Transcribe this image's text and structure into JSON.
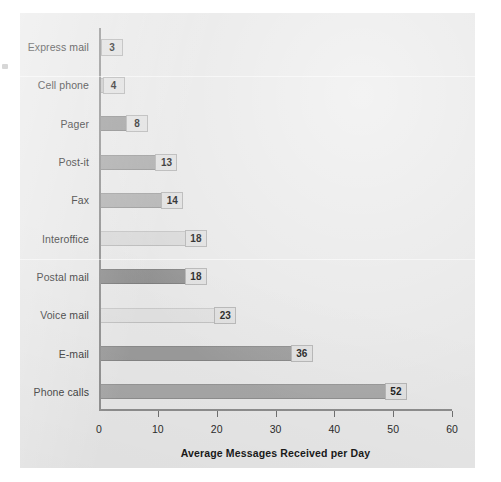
{
  "chart_data": {
    "type": "bar",
    "orientation": "horizontal",
    "title": "",
    "xlabel": "Average Messages Received per Day",
    "ylabel": "",
    "xlim": [
      0,
      60
    ],
    "xticks": [
      0,
      10,
      20,
      30,
      40,
      50,
      60
    ],
    "grid": false,
    "legend": null,
    "categories": [
      "Express mail",
      "Cell phone",
      "Pager",
      "Post-it",
      "Fax",
      "Interoffice",
      "Postal mail",
      "Voice mail",
      "E-mail",
      "Phone calls"
    ],
    "values": [
      3,
      4,
      8,
      13,
      14,
      18,
      18,
      23,
      36,
      52
    ],
    "bar_colors": [
      "#e3e3e3",
      "#c6c6c6",
      "#9b9b9b",
      "#a8a8a8",
      "#b0b0b0",
      "#d8d8d8",
      "#8f8f8f",
      "#e0e0e0",
      "#9a9a9a",
      "#a6a6a6"
    ],
    "bars": [
      {
        "label": "Express mail",
        "value": 3,
        "value_text": "3",
        "color": "#e3e3e3"
      },
      {
        "label": "Cell phone",
        "value": 4,
        "value_text": "4",
        "color": "#c6c6c6"
      },
      {
        "label": "Pager",
        "value": 8,
        "value_text": "8",
        "color": "#9b9b9b"
      },
      {
        "label": "Post-it",
        "value": 13,
        "value_text": "13",
        "color": "#a8a8a8"
      },
      {
        "label": "Fax",
        "value": 14,
        "value_text": "14",
        "color": "#b0b0b0"
      },
      {
        "label": "Interoffice",
        "value": 18,
        "value_text": "18",
        "color": "#d8d8d8"
      },
      {
        "label": "Postal mail",
        "value": 18,
        "value_text": "18",
        "color": "#8f8f8f"
      },
      {
        "label": "Voice mail",
        "value": 23,
        "value_text": "23",
        "color": "#e0e0e0"
      },
      {
        "label": "E-mail",
        "value": 36,
        "value_text": "36",
        "color": "#9a9a9a"
      },
      {
        "label": "Phone calls",
        "value": 52,
        "value_text": "52",
        "color": "#a6a6a6"
      }
    ]
  },
  "style": {
    "panel_background": "#e7e7e7",
    "axis_color": "#8d8d8d",
    "text_color": "#2b2b2b"
  }
}
